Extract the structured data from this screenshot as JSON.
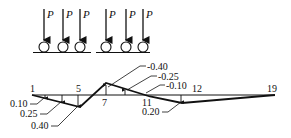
{
  "loads": {
    "label": "P",
    "group_left_x": [
      46,
      63,
      80
    ],
    "group_right_x": [
      107,
      126,
      143
    ]
  },
  "nodes": [
    {
      "label": "1",
      "x": 32
    },
    {
      "label": "5",
      "x": 79
    },
    {
      "label": "7",
      "x": 106
    },
    {
      "label": "11",
      "x": 147
    },
    {
      "label": "12",
      "x": 182
    },
    {
      "label": "19",
      "x": 275
    }
  ],
  "ordinates_positive": [
    "0.10",
    "0.25",
    "0.40"
  ],
  "ordinates_negative": [
    "-0.40",
    "-0.25",
    "-0.10"
  ],
  "ordinate_node12": "0.20",
  "colors": {
    "line": "#111111",
    "background": "#ffffff"
  }
}
